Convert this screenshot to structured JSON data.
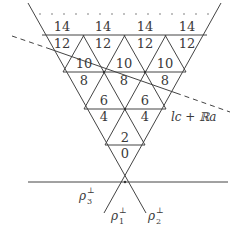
{
  "diagram": {
    "type": "triangular-lattice-wedge",
    "line_color": "#444444",
    "rows": [
      {
        "upper": "14",
        "lower": "12",
        "count": 4
      },
      {
        "upper": "10",
        "lower": "8",
        "count": 3
      },
      {
        "upper": "6",
        "lower": "4",
        "count": 2
      },
      {
        "upper": "2",
        "lower": "0",
        "count": 1
      }
    ],
    "labels": {
      "line": "lc + ℝa",
      "rho3": "ρ",
      "rho3_sub": "3",
      "rho1": "ρ",
      "rho1_sub": "1",
      "rho2": "ρ",
      "rho2_sub": "2",
      "perp": "⊥"
    },
    "continuation": "dotted row above top"
  }
}
